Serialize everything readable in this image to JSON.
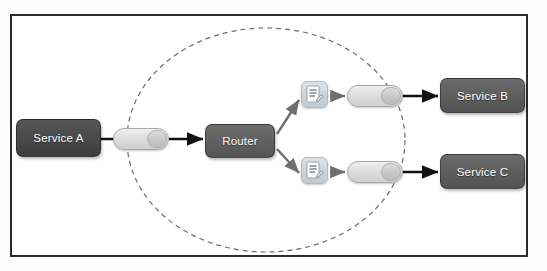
{
  "diagram": {
    "frame": {
      "border_color": "#2b2b2b",
      "background": "#ffffff"
    },
    "boundary": {
      "name": "message-broker-boundary",
      "style": "dashed-ellipse",
      "color": "#6b6b6b"
    },
    "nodes": [
      {
        "id": "service-a",
        "label": "Service A",
        "type": "service",
        "color": "#484848"
      },
      {
        "id": "router",
        "label": "Router",
        "type": "router",
        "color": "#5f5f5f"
      },
      {
        "id": "service-b",
        "label": "Service B",
        "type": "service",
        "color": "#5d5d5d"
      },
      {
        "id": "service-c",
        "label": "Service C",
        "type": "service",
        "color": "#5d5d5d"
      }
    ],
    "queues": [
      {
        "id": "queue-in",
        "label": "",
        "type": "message-queue"
      },
      {
        "id": "queue-top",
        "label": "",
        "type": "message-queue"
      },
      {
        "id": "queue-bottom",
        "label": "",
        "type": "message-queue"
      }
    ],
    "processors": [
      {
        "id": "transform-top",
        "label": "",
        "type": "message-transform",
        "color": "#ccd2d9"
      },
      {
        "id": "transform-bottom",
        "label": "",
        "type": "message-transform",
        "color": "#ccd2d9"
      }
    ],
    "connections": [
      {
        "from": "service-a",
        "to": "queue-in",
        "style": "solid",
        "color": "#111111"
      },
      {
        "from": "queue-in",
        "to": "router",
        "style": "solid",
        "color": "#111111"
      },
      {
        "from": "router",
        "to": "transform-top",
        "style": "solid",
        "color": "#6f6f6f"
      },
      {
        "from": "router",
        "to": "transform-bottom",
        "style": "solid",
        "color": "#6f6f6f"
      },
      {
        "from": "transform-top",
        "to": "queue-top",
        "style": "solid",
        "color": "#6f6f6f"
      },
      {
        "from": "transform-bottom",
        "to": "queue-bottom",
        "style": "solid",
        "color": "#6f6f6f"
      },
      {
        "from": "queue-top",
        "to": "service-b",
        "style": "solid",
        "color": "#111111"
      },
      {
        "from": "queue-bottom",
        "to": "service-c",
        "style": "solid",
        "color": "#111111"
      }
    ]
  }
}
